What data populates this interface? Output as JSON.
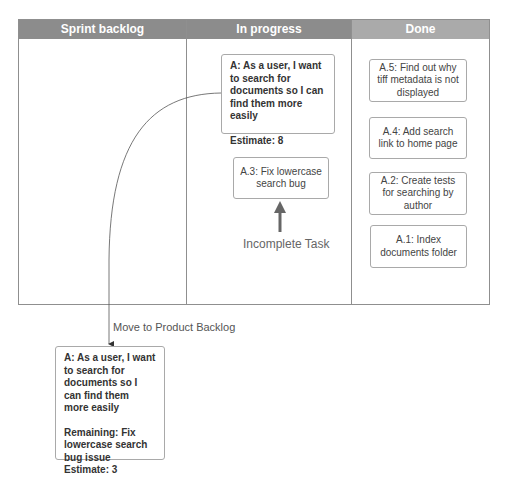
{
  "board": {
    "columns": [
      {
        "title": "Sprint backlog"
      },
      {
        "title": "In progress"
      },
      {
        "title": "Done"
      }
    ],
    "header_colors": {
      "sprint_backlog": "#8c8c8c",
      "in_progress": "#8c8c8c",
      "done": "#aaaaaa"
    }
  },
  "in_progress": {
    "story_card": {
      "title": "A: As a user, I want to search for documents so I can find them more easily",
      "estimate": "Estimate: 8"
    },
    "task_card": {
      "text": "A.3: Fix lowercase search bug"
    },
    "annotation": "Incomplete Task"
  },
  "done": {
    "cards": [
      {
        "text": "A.5: Find out why tiff metadata is not displayed"
      },
      {
        "text": "A.4: Add search link to home page"
      },
      {
        "text": "A.2: Create tests for searching by author"
      },
      {
        "text": "A.1: Index documents folder"
      }
    ]
  },
  "connector": {
    "label": "Move to Product Backlog"
  },
  "product_backlog_card": {
    "title": "A: As a user, I want to search for documents so I can find them more easily",
    "remaining": "Remaining: Fix lowercase search bug issue",
    "estimate": "Estimate: 3"
  }
}
